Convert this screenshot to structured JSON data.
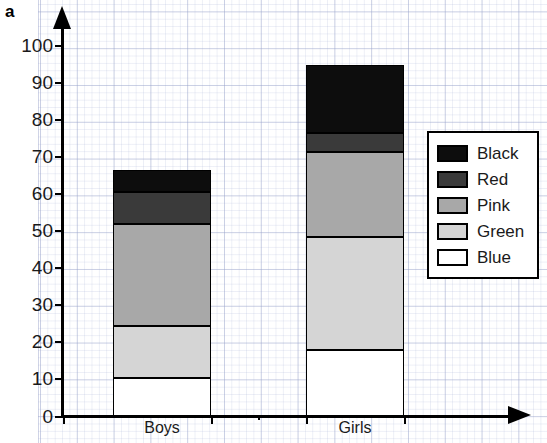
{
  "panel": {
    "letter": "a"
  },
  "legend": {
    "position": "inside-right",
    "entries": [
      {
        "label": "Black",
        "color": "#0d0d0d"
      },
      {
        "label": "Red",
        "color": "#3a3a3a"
      },
      {
        "label": "Pink",
        "color": "#a8a8a8"
      },
      {
        "label": "Green",
        "color": "#d5d5d5"
      },
      {
        "label": "Blue",
        "color": "#ffffff"
      }
    ]
  },
  "axes": {
    "y_ticks": [
      0,
      10,
      20,
      30,
      40,
      50,
      60,
      70,
      80,
      90,
      100
    ],
    "y_tick_labels": [
      "0",
      "10",
      "20",
      "30",
      "40",
      "50",
      "60",
      "70",
      "80",
      "90",
      "100"
    ],
    "x_tick_labels": [
      "Boys",
      "Girls"
    ]
  },
  "chart_data": {
    "type": "bar",
    "stacked": true,
    "title": "",
    "xlabel": "",
    "ylabel": "",
    "ylim": [
      0,
      100
    ],
    "grid": true,
    "categories": [
      "Boys",
      "Girls"
    ],
    "series": [
      {
        "name": "Blue",
        "color": "#ffffff",
        "values": [
          10.3,
          18.0
        ]
      },
      {
        "name": "Green",
        "color": "#d5d5d5",
        "values": [
          14.2,
          30.5
        ]
      },
      {
        "name": "Pink",
        "color": "#a8a8a8",
        "values": [
          27.5,
          23.0
        ]
      },
      {
        "name": "Red",
        "color": "#3a3a3a",
        "values": [
          8.5,
          5.0
        ]
      },
      {
        "name": "Black",
        "color": "#0d0d0d",
        "values": [
          6.0,
          18.5
        ]
      }
    ],
    "cumulative_tops": {
      "Boys": {
        "Blue": 10.3,
        "Green": 24.5,
        "Pink": 52.0,
        "Red": 60.5,
        "Black": 66.5
      },
      "Girls": {
        "Blue": 18.0,
        "Green": 48.5,
        "Pink": 71.5,
        "Red": 76.5,
        "Black": 95.0
      }
    },
    "totals": [
      66.5,
      95.0
    ]
  }
}
